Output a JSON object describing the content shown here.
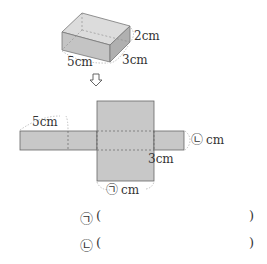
{
  "box": {
    "height_label": "2cm",
    "depth_label": "3cm",
    "length_label": "5cm"
  },
  "arrow": "down-arrow",
  "net": {
    "top_left_label": "5cm",
    "right_label": "cm",
    "right_marker": "㉡",
    "right_depth_label": "3cm",
    "bottom_label": "cm",
    "bottom_marker": "㉠"
  },
  "answers": [
    {
      "marker": "㉠",
      "open": "(",
      "close": ")",
      "value": ""
    },
    {
      "marker": "㉡",
      "open": "(",
      "close": ")",
      "value": ""
    }
  ],
  "colors": {
    "face": "#c8c8c8",
    "face_dark": "#b4b4b4",
    "face_light": "#d8d8d8",
    "edge": "#666666"
  }
}
